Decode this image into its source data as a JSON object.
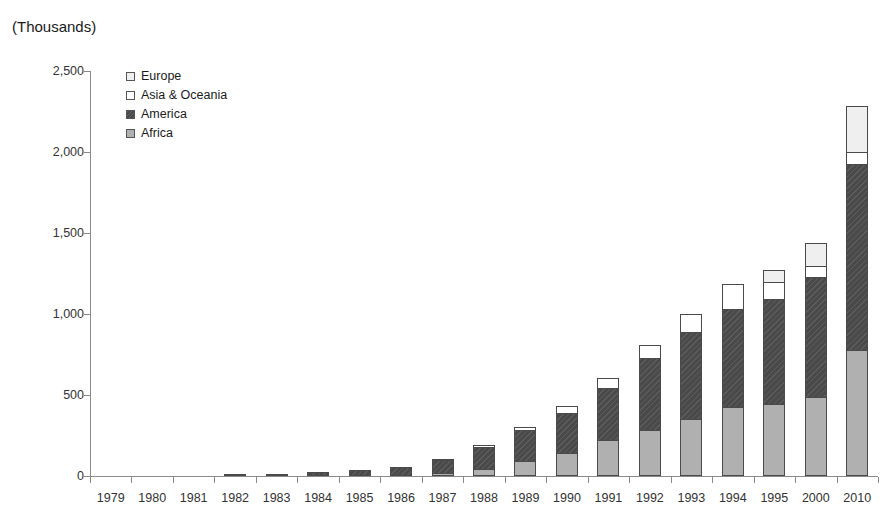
{
  "title_partial": "",
  "units_label": "(Thousands)",
  "legend": {
    "items": [
      {
        "label": "Europe",
        "key": "europe",
        "color": "#efefef"
      },
      {
        "label": "Asia & Oceania",
        "key": "asia",
        "color": "#ffffff"
      },
      {
        "label": "America",
        "key": "america",
        "color": "#4a4a4a"
      },
      {
        "label": "Africa",
        "key": "africa",
        "color": "#b0b0b0"
      }
    ]
  },
  "chart_data": {
    "type": "bar",
    "subtype": "stacked",
    "title": "(Thousands)",
    "xlabel": "",
    "ylabel": "(Thousands)",
    "ylim": [
      0,
      2500
    ],
    "ytick_labels": [
      "0",
      "500",
      "1,000",
      "1,500",
      "2,000",
      "2,500"
    ],
    "yticks": [
      0,
      500,
      1000,
      1500,
      2000,
      2500
    ],
    "grid": false,
    "legend_position": "top-left inside plot",
    "categories": [
      "1979",
      "1980",
      "1981",
      "1982",
      "1983",
      "1984",
      "1985",
      "1986",
      "1987",
      "1988",
      "1989",
      "1990",
      "1991",
      "1992",
      "1993",
      "1994",
      "1995",
      "2000",
      "2010"
    ],
    "series": [
      {
        "name": "Africa",
        "values": [
          0,
          0,
          0,
          0,
          0,
          0,
          0,
          0,
          20,
          45,
          95,
          145,
          220,
          285,
          350,
          425,
          445,
          485,
          775
        ]
      },
      {
        "name": "America",
        "values": [
          0,
          0,
          0,
          10,
          15,
          25,
          35,
          55,
          85,
          140,
          195,
          250,
          330,
          450,
          545,
          610,
          655,
          750,
          1155
        ]
      },
      {
        "name": "Asia & Oceania",
        "values": [
          0,
          0,
          0,
          0,
          0,
          0,
          0,
          0,
          10,
          20,
          25,
          50,
          70,
          85,
          120,
          165,
          110,
          75,
          80
        ]
      },
      {
        "name": "Europe",
        "values": [
          0,
          0,
          0,
          0,
          0,
          0,
          0,
          0,
          0,
          0,
          0,
          0,
          0,
          0,
          0,
          0,
          80,
          150,
          290
        ]
      }
    ],
    "totals": [
      0,
      0,
      0,
      0,
      10,
      15,
      25,
      35,
      55,
      115,
      205,
      315,
      445,
      620,
      820,
      1015,
      1200,
      1290,
      1460,
      2300
    ]
  }
}
